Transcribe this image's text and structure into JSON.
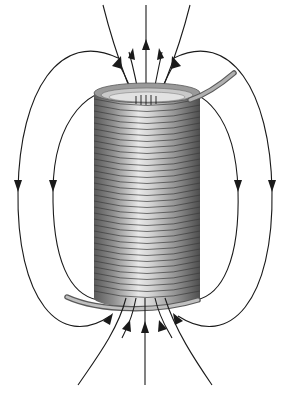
{
  "diagram": {
    "colors": {
      "background": "#ffffff",
      "field_line": "#1a1a1a",
      "coil_light": "#e6e6e6",
      "coil_mid": "#9a9a9a",
      "coil_dark": "#4a4a4a",
      "wire": "#8c8c8c"
    },
    "coil": {
      "turns": 34,
      "x_left": 94,
      "x_right": 200,
      "y_top": 93,
      "y_bottom": 298
    },
    "field_lines": {
      "top_exiting_arrows": 5,
      "bottom_entering_arrows": 5,
      "side_loops_left": 2,
      "side_loops_right": 2,
      "side_arrow_direction": "down",
      "top_arrow_direction": "up",
      "bottom_arrow_direction": "up"
    }
  }
}
